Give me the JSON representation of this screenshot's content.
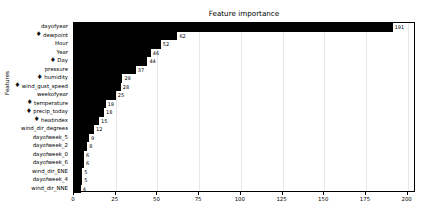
{
  "chart_data": {
    "type": "bar",
    "orientation": "horizontal",
    "title": "Feature importance",
    "xlabel": "",
    "ylabel": "Features",
    "xlim": [
      0,
      205
    ],
    "ylim_categories_top_to_bottom": true,
    "grid": true,
    "grid_axis": "x",
    "legend": null,
    "bar_color": "#000000",
    "xticks": [
      0,
      25,
      50,
      75,
      100,
      125,
      150,
      175,
      200
    ],
    "xtick_labels": [
      "0",
      "25",
      "50",
      "75",
      "100",
      "125",
      "150",
      "175",
      "200"
    ],
    "categories": [
      "dayofyear",
      "dewpoint",
      "Hour",
      "Year",
      "Day",
      "pressure",
      "humidity",
      "wind_gust_speed",
      "weekofyear",
      "temperature",
      "precip_today",
      "heatindex",
      "wind_dir_degrees",
      "dayofweek_5",
      "dayofweek_2",
      "dayofweek_0",
      "dayofweek_6",
      "wind_dir_ENE",
      "dayofweek_4",
      "wind_dir_NNE"
    ],
    "values": [
      191,
      62,
      52,
      46,
      44,
      37,
      29,
      28,
      25,
      19,
      18,
      15,
      12,
      9,
      8,
      6,
      6,
      5,
      5,
      4
    ],
    "value_labels": [
      "191",
      "62",
      "52",
      "46",
      "44",
      "37",
      "29",
      "28",
      "25",
      "19",
      "18",
      "15",
      "12",
      "9",
      "8",
      "6",
      "6",
      "5",
      "5",
      "4"
    ],
    "category_markers": [
      "",
      "thermometer-icon",
      "",
      "",
      "thermometer-icon",
      "",
      "thermometer-icon",
      "thermometer-icon",
      "",
      "thermometer-icon",
      "thermometer-icon",
      "thermometer-icon",
      "",
      "",
      "",
      "",
      "",
      "",
      "",
      ""
    ]
  }
}
